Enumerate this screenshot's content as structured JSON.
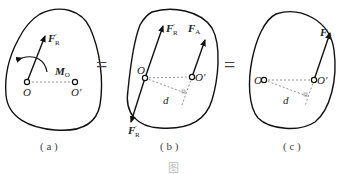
{
  "panels": [
    {
      "id": "a",
      "caption": "( a )",
      "labels": {
        "force": "F",
        "force_sup": "′",
        "force_sub": "R",
        "moment": "M",
        "moment_sub": "O",
        "point_o": "O",
        "point_o_prime": "O′"
      }
    },
    {
      "id": "b",
      "caption": "( b )",
      "labels": {
        "force_top": "F",
        "force_top_sup": "′",
        "force_top_sub": "R",
        "force_a": "F",
        "force_a_sub": "A",
        "force_bottom": "F",
        "force_bottom_sup": "′",
        "force_bottom_sub": "R",
        "point_o": "O",
        "point_o_prime": "O′",
        "distance": "d"
      }
    },
    {
      "id": "c",
      "caption": "( c )",
      "labels": {
        "force": "F",
        "force_sub": "R",
        "point_o": "O",
        "point_o_prime": "O′",
        "distance": "d"
      }
    }
  ],
  "equals_signs": [
    "=",
    "="
  ],
  "figure_caption_partial": "图"
}
